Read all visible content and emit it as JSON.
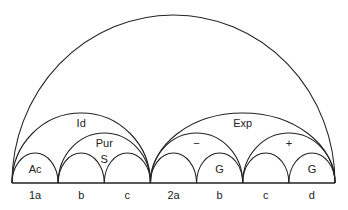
{
  "diagram": {
    "segments": [
      "1a",
      "b",
      "c",
      "2a",
      "b",
      "c",
      "d"
    ],
    "arcs": [
      {
        "label": "",
        "from": 0,
        "to": 7,
        "level": "root"
      },
      {
        "label": "Id",
        "from": 0,
        "to": 3,
        "level": "mid"
      },
      {
        "label": "Exp",
        "from": 3,
        "to": 7,
        "level": "mid"
      },
      {
        "label": "Ac",
        "from": 0,
        "to": 1,
        "level": "leaf"
      },
      {
        "label": "Pur",
        "from": 1,
        "to": 3,
        "level": "pair"
      },
      {
        "label": "S",
        "from": 1,
        "to": 2,
        "level": "leaf",
        "label_pos": "right"
      },
      {
        "label": "",
        "from": 2,
        "to": 3,
        "level": "leaf"
      },
      {
        "label": "−",
        "from": 3,
        "to": 5,
        "level": "pair"
      },
      {
        "label": "",
        "from": 3,
        "to": 4,
        "level": "leaf"
      },
      {
        "label": "G",
        "from": 4,
        "to": 5,
        "level": "leaf"
      },
      {
        "label": "+",
        "from": 5,
        "to": 7,
        "level": "pair"
      },
      {
        "label": "",
        "from": 5,
        "to": 6,
        "level": "leaf"
      },
      {
        "label": "G",
        "from": 6,
        "to": 7,
        "level": "leaf"
      }
    ]
  }
}
